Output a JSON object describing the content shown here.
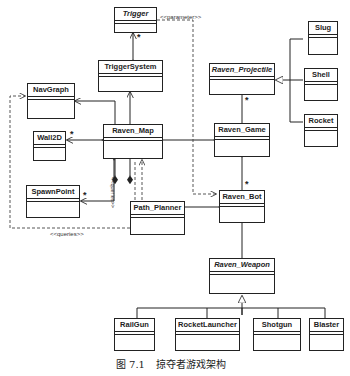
{
  "diagram": {
    "type": "uml-class-diagram",
    "classes": [
      {
        "id": "trigger",
        "name": "Trigger",
        "abstract": true
      },
      {
        "id": "trigger_system",
        "name": "TriggerSystem",
        "abstract": false
      },
      {
        "id": "nav_graph",
        "name": "NavGraph",
        "abstract": false
      },
      {
        "id": "wall2d",
        "name": "Wall2D",
        "abstract": false
      },
      {
        "id": "raven_map",
        "name": "Raven_Map",
        "abstract": false
      },
      {
        "id": "spawn_point",
        "name": "SpawnPoint",
        "abstract": false
      },
      {
        "id": "path_planner",
        "name": "Path_Planner",
        "abstract": false
      },
      {
        "id": "raven_projectile",
        "name": "Raven_Projectile",
        "abstract": true
      },
      {
        "id": "slug",
        "name": "Slug",
        "abstract": false
      },
      {
        "id": "shell",
        "name": "Shell",
        "abstract": false
      },
      {
        "id": "rocket",
        "name": "Rocket",
        "abstract": false
      },
      {
        "id": "raven_game",
        "name": "Raven_Game",
        "abstract": false
      },
      {
        "id": "raven_bot",
        "name": "Raven_Bot",
        "abstract": false
      },
      {
        "id": "raven_weapon",
        "name": "Raven_Weapon",
        "abstract": true
      },
      {
        "id": "railgun",
        "name": "RailGun",
        "abstract": false
      },
      {
        "id": "rocket_launcher",
        "name": "RocketLauncher",
        "abstract": false
      },
      {
        "id": "shotgun",
        "name": "Shotgun",
        "abstract": false
      },
      {
        "id": "blaster",
        "name": "Blaster",
        "abstract": false
      }
    ],
    "relations": [
      {
        "from": "trigger_system",
        "to": "trigger",
        "type": "composition",
        "multiplicity": "*"
      },
      {
        "from": "raven_map",
        "to": "trigger_system",
        "type": "composition"
      },
      {
        "from": "raven_map",
        "to": "nav_graph",
        "type": "composition"
      },
      {
        "from": "raven_map",
        "to": "wall2d",
        "type": "composition",
        "multiplicity": "*"
      },
      {
        "from": "raven_map",
        "to": "spawn_point",
        "type": "composition",
        "multiplicity": "*"
      },
      {
        "from": "raven_game",
        "to": "raven_map",
        "type": "composition"
      },
      {
        "from": "raven_game",
        "to": "raven_projectile",
        "type": "composition",
        "multiplicity": "*"
      },
      {
        "from": "raven_game",
        "to": "raven_bot",
        "type": "composition",
        "multiplicity": "*"
      },
      {
        "from": "raven_bot",
        "to": "path_planner",
        "type": "composition"
      },
      {
        "from": "raven_bot",
        "to": "raven_weapon",
        "type": "association"
      },
      {
        "from": "slug",
        "to": "raven_projectile",
        "type": "generalization"
      },
      {
        "from": "shell",
        "to": "raven_projectile",
        "type": "generalization"
      },
      {
        "from": "rocket",
        "to": "raven_projectile",
        "type": "generalization"
      },
      {
        "from": "railgun",
        "to": "raven_weapon",
        "type": "generalization"
      },
      {
        "from": "rocket_launcher",
        "to": "raven_weapon",
        "type": "generalization"
      },
      {
        "from": "shotgun",
        "to": "raven_weapon",
        "type": "generalization"
      },
      {
        "from": "blaster",
        "to": "raven_weapon",
        "type": "generalization"
      },
      {
        "from": "trigger",
        "to": "raven_bot",
        "type": "dependency",
        "stereotype": "<<parameter>>"
      },
      {
        "from": "path_planner",
        "to": "raven_map",
        "type": "dependency",
        "stereotype": "<<queries>>"
      },
      {
        "from": "path_planner",
        "to": "nav_graph",
        "type": "dependency",
        "stereotype": "<<queries>>"
      }
    ],
    "labels": {
      "parameter": "<<parameter>>",
      "queries_vertical": "<<queries>>",
      "queries_bottom": "<<queries>>",
      "star": "*"
    }
  },
  "caption": {
    "figure_number": "图 7.1",
    "title": "掠夺者游戏架构"
  }
}
